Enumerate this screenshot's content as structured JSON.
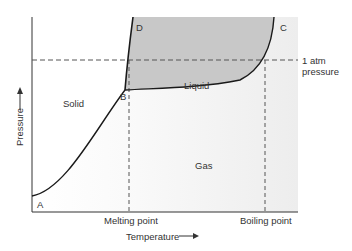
{
  "diagram": {
    "type": "phase_diagram",
    "axes": {
      "xlabel": "Temperature",
      "ylabel": "Pressure"
    },
    "regions": {
      "solid": "Solid",
      "liquid": "Liquid",
      "gas": "Gas"
    },
    "points": {
      "a": "A",
      "b": "B",
      "c": "C",
      "d": "D"
    },
    "reference_lines": {
      "pressure_line_1": "1 atm",
      "pressure_line_2": "pressure",
      "melting": "Melting point",
      "boiling": "Boiling point"
    },
    "colors": {
      "liquid_fill": "#c8c8c8",
      "background_light": "#f6f6f6",
      "curve": "#1a1a1a",
      "dashed": "#555555",
      "text": "#333333"
    }
  }
}
